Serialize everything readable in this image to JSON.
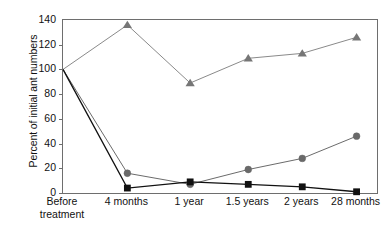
{
  "chart_data": {
    "type": "line",
    "title": "",
    "xlabel": "",
    "ylabel": "Percent of initial ant numbers",
    "categories": [
      "Before treatment",
      "4 months",
      "1 year",
      "1.5 years",
      "2 years",
      "28 months"
    ],
    "category_lines": [
      [
        "Before",
        "treatment"
      ],
      [
        "4 months"
      ],
      [
        "1 year"
      ],
      [
        "1.5 years"
      ],
      [
        "2 years"
      ],
      [
        "28 months"
      ]
    ],
    "ylim": [
      0,
      140
    ],
    "yticks": [
      0,
      20,
      40,
      60,
      80,
      100,
      120,
      140
    ],
    "ytick_labels": [
      "0",
      "20",
      "40",
      "60",
      "80",
      "100",
      "120",
      "140"
    ],
    "grid": false,
    "legend": "none",
    "series": [
      {
        "name": "triangle-series",
        "marker": "triangle",
        "color": "#767676",
        "line_color": "#8a8a8a",
        "values": [
          100,
          136,
          89,
          109,
          113,
          126
        ]
      },
      {
        "name": "circle-series",
        "marker": "circle",
        "color": "#696969",
        "line_color": "#6b6b6b",
        "values": [
          100,
          16,
          7,
          19,
          28,
          46
        ]
      },
      {
        "name": "square-series",
        "marker": "square",
        "color": "#111111",
        "line_color": "#111111",
        "values": [
          100,
          4,
          9,
          7,
          5,
          1
        ]
      }
    ]
  },
  "axis": {
    "frame_color": "#6e6e6e"
  }
}
